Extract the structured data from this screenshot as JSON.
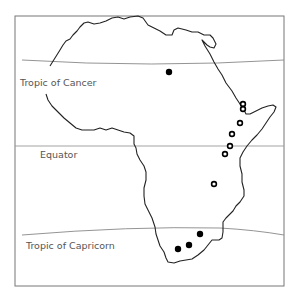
{
  "map": {
    "title": "",
    "frame": {
      "x": 15,
      "y": 16,
      "width": 269,
      "height": 270,
      "color": "#777777"
    },
    "colors": {
      "outline": "#222222",
      "latitude_line": "#888888",
      "label": "#555555",
      "filled_marker": "#000000",
      "open_marker": "#000000"
    },
    "latitude_lines": [
      {
        "name": "Tropic of Cancer",
        "label": "Tropic of Cancer",
        "label_x": 20,
        "label_y": 86
      },
      {
        "name": "Equator",
        "label": "Equator",
        "label_x": 40,
        "label_y": 158
      },
      {
        "name": "Tropic of Capricorn",
        "label": "Tropic of Capricorn",
        "label_x": 26,
        "label_y": 249
      }
    ],
    "markers": {
      "filled": [
        {
          "x": 169,
          "y": 72
        },
        {
          "x": 200,
          "y": 234
        },
        {
          "x": 189,
          "y": 245
        },
        {
          "x": 178,
          "y": 249
        }
      ],
      "open": [
        {
          "x": 243,
          "y": 104
        },
        {
          "x": 243,
          "y": 109
        },
        {
          "x": 240,
          "y": 123
        },
        {
          "x": 232,
          "y": 134
        },
        {
          "x": 230,
          "y": 146
        },
        {
          "x": 225,
          "y": 154
        },
        {
          "x": 214,
          "y": 184
        }
      ]
    },
    "continent": "Africa"
  }
}
